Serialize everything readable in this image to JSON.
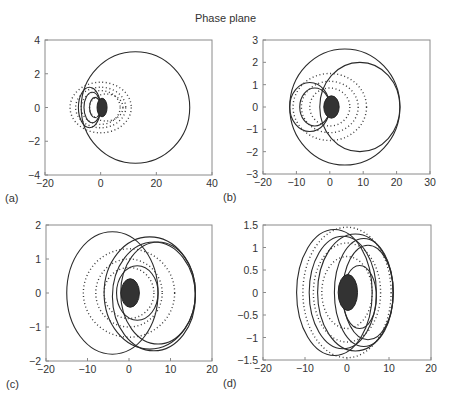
{
  "figure": {
    "title": "Phase plane"
  },
  "chart_data": [
    {
      "type": "scatter",
      "panel_label": "(a)",
      "title": "",
      "xlabel": "",
      "ylabel": "",
      "xlim": [
        -20,
        40
      ],
      "ylim": [
        -4,
        4
      ],
      "xticks": [
        -20,
        0,
        20,
        40
      ],
      "yticks": [
        -4,
        -2,
        0,
        2,
        4
      ],
      "xtick_labels": [
        "−20",
        "0",
        "20",
        "40"
      ],
      "ytick_labels": [
        "−4",
        "−2",
        "0",
        "2",
        "4"
      ],
      "grid": false,
      "series": [
        {
          "name": "outer orbit (solid)",
          "style": "line",
          "ellipses": [
            {
              "cx": 12.5,
              "cy": 0,
              "rx": 19.5,
              "ry": 3.3
            }
          ]
        },
        {
          "name": "inner loops (solid)",
          "style": "line",
          "ellipses": [
            {
              "cx": -4,
              "cy": 0,
              "rx": 4,
              "ry": 1.2
            },
            {
              "cx": -3,
              "cy": 0,
              "rx": 3,
              "ry": 0.9
            },
            {
              "cx": -2,
              "cy": 0,
              "rx": 2,
              "ry": 0.6
            }
          ]
        },
        {
          "name": "dotted trajectories",
          "style": "dots",
          "ellipses": [
            {
              "cx": 0,
              "cy": 0,
              "rx": 11,
              "ry": 1.5
            },
            {
              "cx": 0,
              "cy": 0,
              "rx": 9,
              "ry": 1.2
            },
            {
              "cx": 0,
              "cy": 0,
              "rx": 7,
              "ry": 1.0
            },
            {
              "cx": 2,
              "cy": 0,
              "rx": 6,
              "ry": 0.8
            }
          ]
        },
        {
          "name": "core",
          "style": "filled",
          "ellipses": [
            {
              "cx": 0.5,
              "cy": 0,
              "rx": 1.8,
              "ry": 0.55
            }
          ]
        }
      ]
    },
    {
      "type": "scatter",
      "panel_label": "(b)",
      "title": "",
      "xlabel": "",
      "ylabel": "",
      "xlim": [
        -20,
        30
      ],
      "ylim": [
        -3,
        3
      ],
      "xticks": [
        -20,
        -10,
        0,
        10,
        20,
        30
      ],
      "yticks": [
        -3,
        -2,
        -1,
        0,
        1,
        2,
        3
      ],
      "xtick_labels": [
        "−20",
        "−10",
        "0",
        "10",
        "20",
        "30"
      ],
      "ytick_labels": [
        "−3",
        "−2",
        "−1",
        "0",
        "1",
        "2",
        "3"
      ],
      "grid": false,
      "series": [
        {
          "name": "outer orbit (solid)",
          "style": "line",
          "ellipses": [
            {
              "cx": 4.5,
              "cy": 0,
              "rx": 16.5,
              "ry": 2.6
            },
            {
              "cx": 9,
              "cy": 0,
              "rx": 12,
              "ry": 2.0
            }
          ]
        },
        {
          "name": "inner loops (solid)",
          "style": "line",
          "ellipses": [
            {
              "cx": -6,
              "cy": 0,
              "rx": 6,
              "ry": 1.1
            },
            {
              "cx": -4.5,
              "cy": 0,
              "rx": 4.5,
              "ry": 0.85
            }
          ]
        },
        {
          "name": "dotted trajectories",
          "style": "dots",
          "ellipses": [
            {
              "cx": 0,
              "cy": 0,
              "rx": 11,
              "ry": 1.5
            },
            {
              "cx": 0,
              "cy": 0,
              "rx": 8.5,
              "ry": 1.15
            },
            {
              "cx": 0,
              "cy": 0,
              "rx": 6,
              "ry": 0.85
            }
          ]
        },
        {
          "name": "core",
          "style": "filled",
          "ellipses": [
            {
              "cx": 0.5,
              "cy": 0,
              "rx": 2.3,
              "ry": 0.5
            }
          ]
        }
      ]
    },
    {
      "type": "scatter",
      "panel_label": "(c)",
      "title": "",
      "xlabel": "",
      "ylabel": "",
      "xlim": [
        -20,
        20
      ],
      "ylim": [
        -2,
        2
      ],
      "xticks": [
        -20,
        -10,
        0,
        10,
        20
      ],
      "yticks": [
        -2,
        -1,
        0,
        1,
        2
      ],
      "xtick_labels": [
        "−20",
        "−10",
        "0",
        "10",
        "20"
      ],
      "ytick_labels": [
        "−2",
        "−1",
        "0",
        "1",
        "2"
      ],
      "grid": false,
      "series": [
        {
          "name": "solid orbits",
          "style": "line",
          "ellipses": [
            {
              "cx": -4,
              "cy": 0,
              "rx": 11,
              "ry": 1.8
            },
            {
              "cx": 6,
              "cy": -0.1,
              "rx": 10,
              "ry": 1.6
            },
            {
              "cx": 7,
              "cy": 0,
              "rx": 9,
              "ry": 1.5
            },
            {
              "cx": 5,
              "cy": 0,
              "rx": 11,
              "ry": 1.65
            },
            {
              "cx": 2,
              "cy": 0,
              "rx": 5,
              "ry": 0.8
            }
          ]
        },
        {
          "name": "dotted trajectories",
          "style": "dots",
          "ellipses": [
            {
              "cx": 0,
              "cy": 0,
              "rx": 11,
              "ry": 1.3
            },
            {
              "cx": 0,
              "cy": 0,
              "rx": 8,
              "ry": 1.0
            },
            {
              "cx": 0,
              "cy": 0,
              "rx": 6,
              "ry": 0.75
            }
          ]
        },
        {
          "name": "core",
          "style": "filled",
          "ellipses": [
            {
              "cx": 0.3,
              "cy": 0,
              "rx": 2.2,
              "ry": 0.42
            }
          ]
        }
      ]
    },
    {
      "type": "scatter",
      "panel_label": "(d)",
      "title": "",
      "xlabel": "",
      "ylabel": "",
      "xlim": [
        -20,
        20
      ],
      "ylim": [
        -1.5,
        1.5
      ],
      "xticks": [
        -20,
        -10,
        0,
        10,
        20
      ],
      "yticks": [
        -1.5,
        -1,
        -0.5,
        0,
        0.5,
        1,
        1.5
      ],
      "xtick_labels": [
        "−20",
        "−10",
        "0",
        "10",
        "20"
      ],
      "ytick_labels": [
        "−1.5",
        "−1",
        "−0.5",
        "0",
        "0.5",
        "1",
        "1.5"
      ],
      "grid": false,
      "series": [
        {
          "name": "solid orbits",
          "style": "line",
          "ellipses": [
            {
              "cx": -3,
              "cy": 0,
              "rx": 9,
              "ry": 1.4
            },
            {
              "cx": 2,
              "cy": 0,
              "rx": 9,
              "ry": 1.3
            },
            {
              "cx": 5,
              "cy": 0,
              "rx": 6,
              "ry": 1.05
            },
            {
              "cx": 4,
              "cy": 0,
              "rx": 7,
              "ry": 1.2
            },
            {
              "cx": -1,
              "cy": 0,
              "rx": 8,
              "ry": 1.25
            },
            {
              "cx": 3,
              "cy": -0.1,
              "rx": 4,
              "ry": 0.7
            }
          ]
        },
        {
          "name": "dotted trajectories",
          "style": "dots",
          "ellipses": [
            {
              "cx": 0,
              "cy": 0,
              "rx": 10.5,
              "ry": 1.45
            },
            {
              "cx": 0,
              "cy": 0,
              "rx": 8,
              "ry": 1.1
            },
            {
              "cx": 0,
              "cy": 0,
              "rx": 6,
              "ry": 0.8
            }
          ]
        },
        {
          "name": "core",
          "style": "filled",
          "ellipses": [
            {
              "cx": 0.2,
              "cy": 0,
              "rx": 2.3,
              "ry": 0.4
            }
          ]
        }
      ]
    }
  ],
  "layout": {
    "panels": [
      {
        "box": [
          45,
          40,
          212,
          175
        ]
      },
      {
        "box": [
          263,
          40,
          430,
          174
        ]
      },
      {
        "box": [
          46,
          225,
          212,
          361
        ]
      },
      {
        "box": [
          263,
          225,
          431,
          360
        ]
      }
    ],
    "colors": {
      "ink": "#2a2a2a",
      "axis": "#8a8a8a",
      "dots": "#3a3a3a"
    }
  }
}
